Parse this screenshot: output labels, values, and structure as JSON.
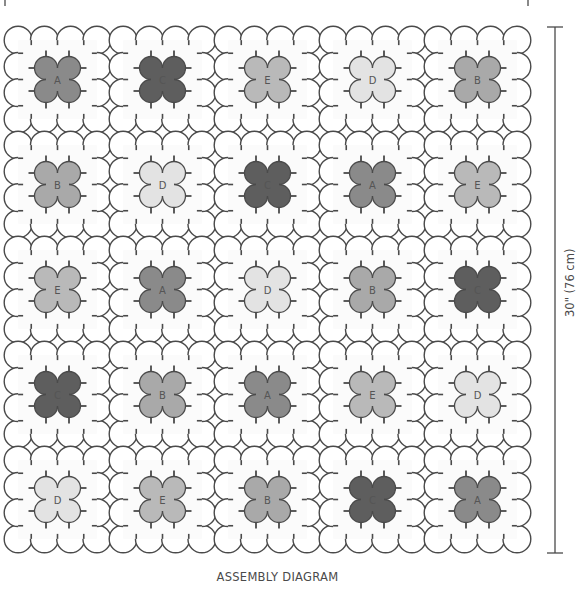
{
  "caption": "ASSEMBLY DIAGRAM",
  "dimension": {
    "label": "30\" (76 cm)",
    "orientation": "vertical"
  },
  "grid": {
    "rows": 5,
    "cols": 5,
    "circles_per_block_side": 4,
    "blocks": [
      [
        "A",
        "C",
        "E",
        "D",
        "B"
      ],
      [
        "B",
        "D",
        "C",
        "A",
        "E"
      ],
      [
        "E",
        "A",
        "D",
        "B",
        "C"
      ],
      [
        "C",
        "B",
        "A",
        "E",
        "D"
      ],
      [
        "D",
        "E",
        "B",
        "C",
        "A"
      ]
    ]
  },
  "colors": {
    "A": "#8a8a8a",
    "B": "#a9a9a9",
    "C": "#5e5e5e",
    "D": "#e3e3e3",
    "E": "#b9b9b9",
    "outline": "#4a4a4a",
    "background": "#ffffff",
    "block_fill": "#fbfbfb"
  }
}
